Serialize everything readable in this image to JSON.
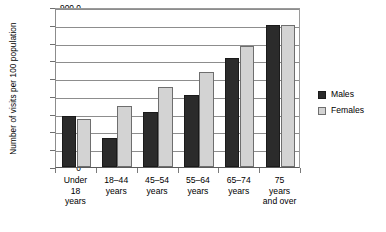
{
  "chart_data": {
    "type": "bar",
    "title": "",
    "xlabel": "",
    "ylabel": "Number of visits per 100 population",
    "ylim": [
      0,
      900
    ],
    "ytick_values": [
      900,
      800,
      700,
      600,
      500,
      400,
      300,
      200,
      100,
      0
    ],
    "ytick_labels": [
      "900.0",
      "800.0",
      "700.0",
      "600.0",
      "500.0",
      "400.0",
      "300.0",
      "200.0",
      "100.0",
      "0"
    ],
    "grid": "horizontal",
    "legend_position": "right",
    "categories": [
      "Under\n18\nyears",
      "18–44\nyears",
      "45–54\nyears",
      "55–64\nyears",
      "65–74\nyears",
      "75\nyears\nand over"
    ],
    "category_lines": [
      [
        "Under",
        "18",
        "years"
      ],
      [
        "18–44",
        "years"
      ],
      [
        "45–54",
        "years"
      ],
      [
        "55–64",
        "years"
      ],
      [
        "65–74",
        "years"
      ],
      [
        "75",
        "years",
        "and over"
      ]
    ],
    "series": [
      {
        "name": "Males",
        "color": "#2b2b2b",
        "values": [
          285,
          165,
          310,
          405,
          615,
          800
        ]
      },
      {
        "name": "Females",
        "color": "#d3d3d3",
        "values": [
          270,
          345,
          450,
          535,
          680,
          800
        ]
      }
    ]
  },
  "legend": {
    "items": [
      {
        "label": "Males"
      },
      {
        "label": "Females"
      }
    ]
  }
}
